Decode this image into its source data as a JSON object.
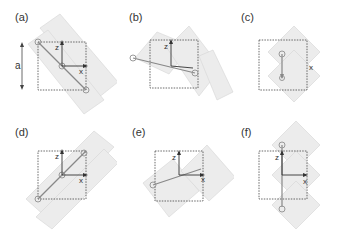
{
  "figure": {
    "panels": [
      {
        "label": "(a)",
        "x_axis": "x",
        "z_axis": "z",
        "orientation": "diagonal-down-right",
        "show_dimension": true
      },
      {
        "label": "(b)",
        "x_axis": "x",
        "z_axis": "z",
        "orientation": "shallow-down-right",
        "show_dimension": false
      },
      {
        "label": "(c)",
        "x_axis": "x",
        "z_axis": "z",
        "orientation": "vertical-stack",
        "show_dimension": false
      },
      {
        "label": "(d)",
        "x_axis": "x",
        "z_axis": "z",
        "orientation": "diagonal-up-right",
        "show_dimension": false
      },
      {
        "label": "(e)",
        "x_axis": "x",
        "z_axis": "z",
        "orientation": "shallow-up-right",
        "show_dimension": false
      },
      {
        "label": "(f)",
        "x_axis": "x",
        "z_axis": "z",
        "orientation": "vertical-tall",
        "show_dimension": false
      }
    ],
    "dimension_label": "a",
    "colors": {
      "box": "#444444",
      "axis": "#333333",
      "molecule": "#d8d8d8",
      "bond": "#888888"
    }
  }
}
